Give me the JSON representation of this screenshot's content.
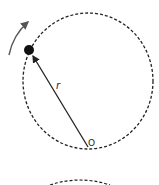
{
  "diagram": {
    "labels": {
      "radius": "r",
      "origin": "O"
    },
    "colors": {
      "stroke": "#222222",
      "rotation_arrow": "#555555",
      "background": "#ffffff"
    },
    "circle": {
      "cx": 88,
      "cy": 81,
      "r": 67,
      "style": "dashed"
    },
    "particle": {
      "cx": 29,
      "cy": 50,
      "r": 5
    },
    "second_circle_partial": {
      "visible": true,
      "style": "dashed"
    }
  }
}
